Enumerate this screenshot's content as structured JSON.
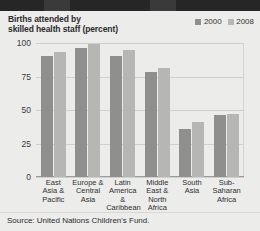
{
  "chart_data": {
    "type": "bar",
    "title": "Births attended by skilled health staff (percent)",
    "xlabel": "",
    "ylabel": "",
    "ylim": [
      0,
      100
    ],
    "yticks": [
      0,
      25,
      50,
      75,
      100
    ],
    "grid": true,
    "legend_position": "top-right",
    "categories": [
      "East Asia & Pacific",
      "Europe & Central Asia",
      "Latin America & Caribbean",
      "Middle East & North Africa",
      "South Asia",
      "Sub-Saharan Africa"
    ],
    "series": [
      {
        "name": "2000",
        "color": "#8f8f8d",
        "values": [
          90,
          96,
          90,
          78,
          36,
          46
        ]
      },
      {
        "name": "2008",
        "color": "#b6b6b3",
        "values": [
          93,
          99,
          95,
          81,
          41,
          47
        ]
      }
    ]
  },
  "title": {
    "line1": "Births attended by",
    "line2": "skilled health staff (percent)"
  },
  "legend": {
    "items": [
      {
        "label": "2000",
        "color": "#8f8f8d"
      },
      {
        "label": "2008",
        "color": "#b6b6b3"
      }
    ]
  },
  "axis": {
    "y_ticks": [
      "100",
      "75",
      "50",
      "25",
      "0"
    ]
  },
  "x_labels": [
    {
      "lines": [
        "East",
        "Asia &",
        "Pacific"
      ]
    },
    {
      "lines": [
        "Europe &",
        "Central",
        "Asia"
      ]
    },
    {
      "lines": [
        "Latin",
        "America &",
        "Caribbean"
      ]
    },
    {
      "lines": [
        "Middle",
        "East &",
        "North",
        "Africa"
      ]
    },
    {
      "lines": [
        "South",
        "Asia"
      ]
    },
    {
      "lines": [
        "Sub-",
        "Saharan",
        "Africa"
      ]
    }
  ],
  "source": {
    "text": "Source: United Nations Children's Fund."
  }
}
